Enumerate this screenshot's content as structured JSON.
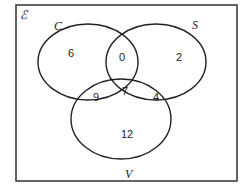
{
  "diagram": {
    "type": "venn",
    "universal_label": "ℰ",
    "sets": [
      {
        "name": "C",
        "label": "C"
      },
      {
        "name": "S",
        "label": "S"
      },
      {
        "name": "V",
        "label": "V"
      }
    ],
    "regions": {
      "C_only": "6",
      "C_and_S_only": "0",
      "S_only": "2",
      "C_and_V_only": "9",
      "C_and_S_and_V": "7",
      "S_and_V_only": "4",
      "V_only": "12"
    },
    "colors": {
      "stroke": "#222222",
      "background": "#ffffff"
    }
  }
}
